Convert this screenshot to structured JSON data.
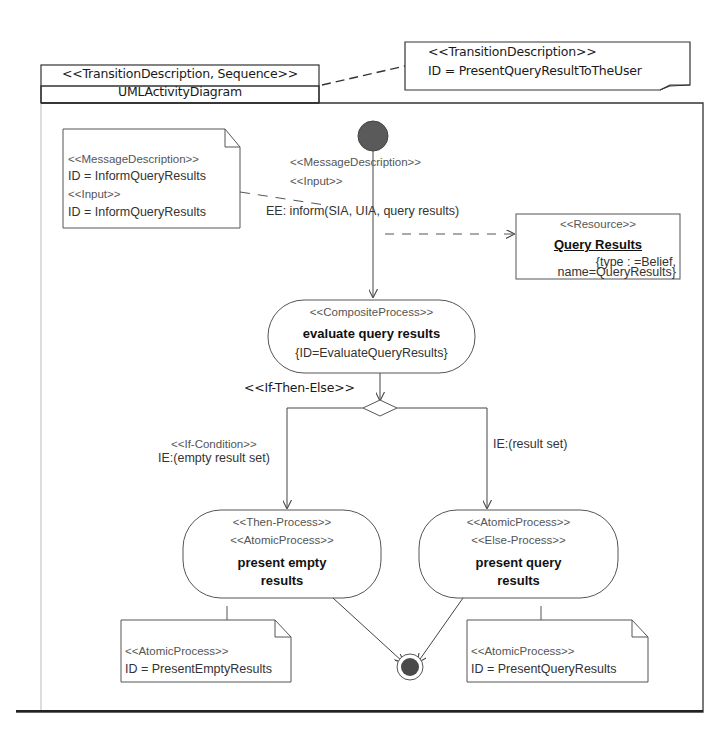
{
  "diagram": {
    "frame": {
      "stereotype": "<<TransitionDescription, Sequence>>",
      "name": "UMLActivityDiagram"
    },
    "transition_note": {
      "stereotype": "<<TransitionDescription>>",
      "id": "ID = PresentQueryResultToTheUser"
    },
    "message_note": {
      "line1": "<<MessageDescription>>",
      "line2": "ID = InformQueryResults",
      "line3": "<<Input>>",
      "line4": "ID = InformQueryResults"
    },
    "initial_edge": {
      "stereotype1": "<<MessageDescription>>",
      "stereotype2": "<<Input>>",
      "label": "EE: inform(SIA, UIA, query results)"
    },
    "resource": {
      "stereotype": "<<Resource>>",
      "name": "Query Results",
      "attr1": "{type : =Belief,",
      "attr2": "name=QueryResults}"
    },
    "composite_process": {
      "stereotype": "<<CompositeProcess>>",
      "name": "evaluate query results",
      "id": "{ID=EvaluateQueryResults}"
    },
    "decision": {
      "stereotype": "<<If-Then-Else>>"
    },
    "left_branch": {
      "stereotype": "<<If-Condition>>",
      "guard": "IE:(empty result set)"
    },
    "right_branch": {
      "guard": "IE:(result set)"
    },
    "then_process": {
      "stereotype1": "<<Then-Process>>",
      "stereotype2": "<<AtomicProcess>>",
      "name1": "present empty",
      "name2": "results"
    },
    "else_process": {
      "stereotype1": "<<AtomicProcess>>",
      "stereotype2": "<<Else-Process>>",
      "name1": "present query",
      "name2": "results"
    },
    "empty_note": {
      "stereotype": "<<AtomicProcess>>",
      "id": "ID = PresentEmptyResults"
    },
    "query_note": {
      "stereotype": "<<AtomicProcess>>",
      "id": "ID = PresentQueryResults"
    }
  },
  "colors": {
    "line": "#333333",
    "node_fill": "#555555",
    "background": "#ffffff"
  }
}
